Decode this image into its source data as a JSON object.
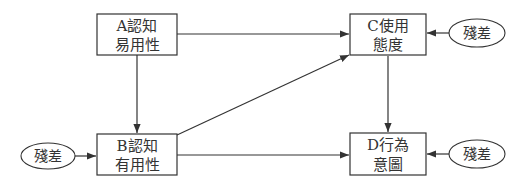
{
  "colors": {
    "stroke": "#333333",
    "text": "#333333",
    "background": "#ffffff"
  },
  "nodes": {
    "a": {
      "line1": "A認知",
      "line2": "易用性"
    },
    "b": {
      "line1": "B認知",
      "line2": "有用性"
    },
    "c": {
      "line1": "C使用",
      "line2": "態度"
    },
    "d": {
      "line1": "D行為",
      "line2": "意圖"
    }
  },
  "residuals": {
    "b": "殘差",
    "c": "殘差",
    "d": "殘差"
  },
  "edges": [
    {
      "from": "A認知易用性",
      "to": "C使用態度"
    },
    {
      "from": "A認知易用性",
      "to": "B認知有用性"
    },
    {
      "from": "B認知有用性",
      "to": "C使用態度"
    },
    {
      "from": "B認知有用性",
      "to": "D行為意圖"
    },
    {
      "from": "C使用態度",
      "to": "D行為意圖"
    },
    {
      "from": "殘差",
      "to": "B認知有用性"
    },
    {
      "from": "殘差",
      "to": "C使用態度"
    },
    {
      "from": "殘差",
      "to": "D行為意圖"
    }
  ]
}
